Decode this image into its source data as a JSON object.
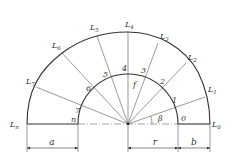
{
  "figure": {
    "center": {
      "x": 128,
      "y": 124
    },
    "inner_radius_px": 50,
    "outer_labels": [
      {
        "id": "L0",
        "base": "L",
        "sub": "0",
        "x": 212,
        "y": 127
      },
      {
        "id": "L1",
        "base": "L",
        "sub": "1",
        "x": 208,
        "y": 92
      },
      {
        "id": "L2",
        "base": "L",
        "sub": "2",
        "x": 188,
        "y": 60
      },
      {
        "id": "L3",
        "base": "L",
        "sub": "3",
        "x": 160,
        "y": 39
      },
      {
        "id": "L4",
        "base": "L",
        "sub": "4",
        "x": 126,
        "y": 26
      },
      {
        "id": "L5",
        "base": "L",
        "sub": "5",
        "x": 90,
        "y": 30
      },
      {
        "id": "L6",
        "base": "L",
        "sub": "6",
        "x": 52,
        "y": 48
      },
      {
        "id": "L7",
        "base": "L",
        "sub": "7",
        "x": 26,
        "y": 84
      },
      {
        "id": "Ln",
        "base": "L",
        "sub": "n",
        "x": 10,
        "y": 127
      }
    ],
    "inner_labels": [
      {
        "id": "p0",
        "text": "0",
        "x": 180,
        "y": 122
      },
      {
        "id": "p1",
        "text": "1",
        "x": 174,
        "y": 103
      },
      {
        "id": "p2",
        "text": "2",
        "x": 162,
        "y": 84
      },
      {
        "id": "p3",
        "text": "3",
        "x": 142,
        "y": 73
      },
      {
        "id": "p4",
        "text": "4",
        "x": 122,
        "y": 71
      },
      {
        "id": "p5",
        "text": "5",
        "x": 104,
        "y": 77
      },
      {
        "id": "p6",
        "text": "6",
        "x": 86,
        "y": 91
      },
      {
        "id": "p7",
        "text": "7",
        "x": 74,
        "y": 112
      },
      {
        "id": "pn",
        "text": "n",
        "x": 71,
        "y": 122
      }
    ],
    "angle_labels": [
      {
        "id": "beta",
        "text": "β",
        "x": 159,
        "y": 120
      },
      {
        "id": "f",
        "text": "f",
        "x": 133,
        "y": 86
      }
    ],
    "dimensions": [
      {
        "id": "a",
        "text": "a",
        "x1": 27,
        "x2": 78,
        "label_x": 52
      },
      {
        "id": "r",
        "text": "r",
        "x1": 128,
        "x2": 178,
        "label_x": 155
      },
      {
        "id": "b",
        "text": "b",
        "x1": 178,
        "x2": 210,
        "label_x": 194
      }
    ]
  }
}
